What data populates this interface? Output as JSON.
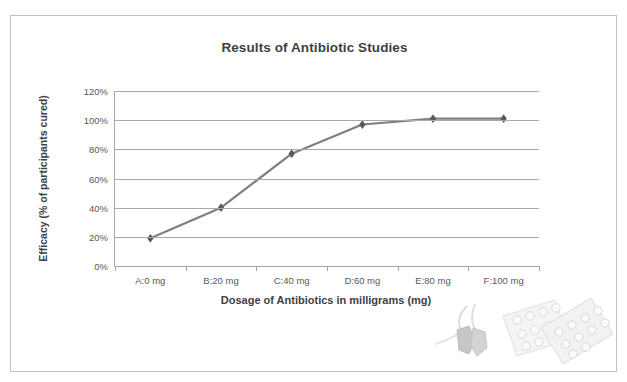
{
  "chart_data": {
    "type": "line",
    "title": "Results of Antibiotic Studies",
    "xlabel": "Dosage of Antibiotics in milligrams (mg)",
    "ylabel": "Efficacy (% of participants cured)",
    "categories": [
      "A:0 mg",
      "B:20 mg",
      "C:40 mg",
      "D:60 mg",
      "E:80 mg",
      "F:100 mg"
    ],
    "values": [
      19,
      40,
      77,
      97,
      101,
      101
    ],
    "value_suffix": "%",
    "ylim": [
      0,
      120
    ],
    "ytick_labels": [
      "0%",
      "20%",
      "40%",
      "60%",
      "80%",
      "100%",
      "120%"
    ],
    "ytick_values": [
      0,
      20,
      40,
      60,
      80,
      100,
      120
    ],
    "grid": true,
    "legend": "none",
    "marker": "diamond",
    "series": [
      {
        "name": "Efficacy",
        "values": [
          19,
          40,
          77,
          97,
          101,
          101
        ]
      }
    ],
    "colors": {
      "line": "#7f7f7f",
      "marker": "#595959",
      "gridline": "#a9a9a9",
      "axis": "#a6a6a6",
      "text": "#595959",
      "title_text": "#3f3f3f",
      "border": "#bfbfbf",
      "background": "#ffffff"
    }
  },
  "decoration": {
    "name": "pill-blister-packs-and-stethoscope-image"
  }
}
